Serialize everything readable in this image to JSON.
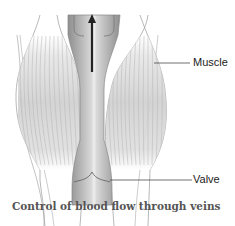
{
  "diagram": {
    "labels": {
      "muscle": "Muscle",
      "valve": "Valve"
    },
    "caption": "Control of blood flow through veins",
    "colors": {
      "muscle_fill": "#d6d6d6",
      "vein_fill": "#9c9c9c",
      "vein_center": "#e4e4e4",
      "arrow": "#222222",
      "outline": "#888888"
    }
  }
}
